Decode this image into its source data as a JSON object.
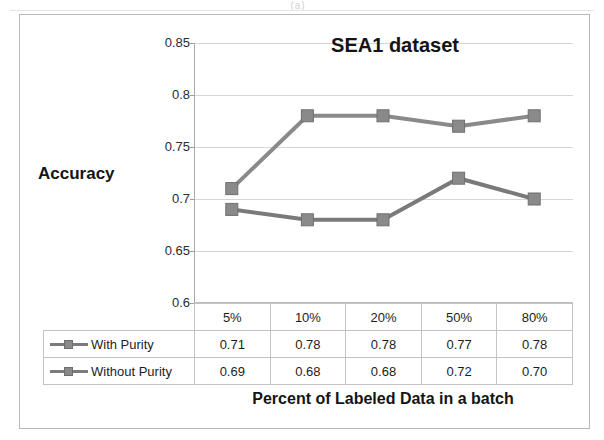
{
  "figure": {
    "artifact_text": "(a)"
  },
  "chart_data": {
    "type": "line",
    "title": "SEA1 dataset",
    "xlabel": "Percent of Labeled Data in a batch",
    "ylabel": "Accuracy",
    "categories": [
      "5%",
      "10%",
      "20%",
      "50%",
      "80%"
    ],
    "ylim": [
      0.6,
      0.85
    ],
    "yticks": [
      "0.6",
      "0.65",
      "0.7",
      "0.75",
      "0.8",
      "0.85"
    ],
    "ytick_values": [
      0.6,
      0.65,
      0.7,
      0.75,
      0.8,
      0.85
    ],
    "grid": true,
    "legend_position": "table-left",
    "series": [
      {
        "name": "With Purity",
        "values": [
          0.71,
          0.78,
          0.78,
          0.77,
          0.78
        ],
        "labels": [
          "0.71",
          "0.78",
          "0.78",
          "0.77",
          "0.78"
        ],
        "color": "#8a8a8a",
        "marker": "square"
      },
      {
        "name": "Without Purity",
        "values": [
          0.69,
          0.68,
          0.68,
          0.72,
          0.7
        ],
        "labels": [
          "0.69",
          "0.68",
          "0.68",
          "0.72",
          "0.70"
        ],
        "color": "#7a7a7a",
        "marker": "square"
      }
    ]
  },
  "table": {
    "header": [
      "5%",
      "10%",
      "20%",
      "50%",
      "80%"
    ],
    "rows": [
      {
        "label": "With Purity",
        "cells": [
          "0.71",
          "0.78",
          "0.78",
          "0.77",
          "0.78"
        ]
      },
      {
        "label": "Without Purity",
        "cells": [
          "0.69",
          "0.68",
          "0.68",
          "0.72",
          "0.70"
        ]
      }
    ]
  },
  "colors": {
    "series_line": "#7b7b7b",
    "marker_fill": "#8a8a8a",
    "gridline": "#d6d6d6",
    "axis": "#a8a8a8",
    "frame": "#b9b9b9"
  }
}
